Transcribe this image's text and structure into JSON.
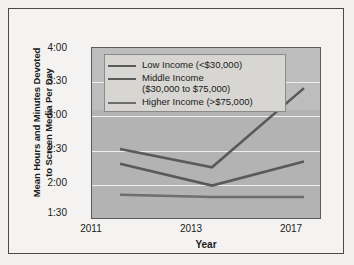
{
  "chart_data": {
    "type": "line",
    "title": "",
    "xlabel": "Year",
    "ylabel_line1": "Mean Hours and Minutes Devoted",
    "ylabel_line2": "to Screen Media Per Day",
    "categories": [
      "2011",
      "2013",
      "2017"
    ],
    "x_tick_labels": [
      "2011",
      "2013",
      "2017"
    ],
    "y_tick_labels": [
      "1:30",
      "2:00",
      "2:30",
      "3:00",
      "3:30",
      "4:00"
    ],
    "y_tick_minutes": [
      90,
      120,
      150,
      180,
      210,
      240
    ],
    "ylim_minutes": [
      90,
      240
    ],
    "grid": true,
    "legend_position": "upper-left-inside",
    "series": [
      {
        "name": "Low Income (<$30,000)",
        "values_label": [
          "2:32",
          "2:16",
          "3:25"
        ],
        "values": [
          152,
          136,
          205
        ],
        "color": "#5a5a5a"
      },
      {
        "name": "Middle Income\n($30,000 to $75,000)",
        "values_label": [
          "2:19",
          "2:00",
          "2:21"
        ],
        "values": [
          139,
          120,
          141
        ],
        "color": "#5a5a5a"
      },
      {
        "name": "Higher Income (>$75,000)",
        "values_label": [
          "1:52",
          "1:50",
          "1:50"
        ],
        "values": [
          112,
          110,
          110
        ],
        "color": "#6e6e6e"
      }
    ]
  },
  "legend": {
    "entries": [
      "Low Income (<$30,000)",
      "Middle Income\n($30,000 to $75,000)",
      "Higher Income (>$75,000)"
    ]
  },
  "axes": {
    "x_title": "Year",
    "y_title_line1": "Mean Hours and Minutes Devoted",
    "y_title_line2": "to Screen Media Per Day",
    "y_ticks": [
      "4:00",
      "3:30",
      "3:00",
      "2:30",
      "2:00",
      "1:30"
    ],
    "x_ticks": [
      "2011",
      "2013",
      "2017"
    ]
  },
  "colors": {
    "plot_background": "#b3b3b3",
    "plot_background_upper": "#bdbdbd",
    "gridline": "#efefef",
    "legend_background": "#d7d6d2",
    "series_line": "#5a5a5a",
    "figure_background": "#f4f3f1",
    "text": "#1a1a1a"
  }
}
